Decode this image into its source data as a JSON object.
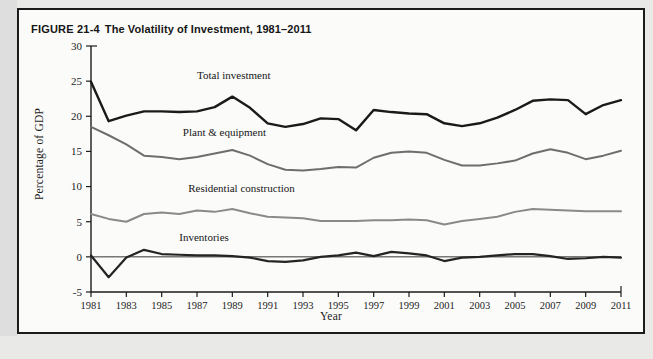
{
  "figure": {
    "number": "FIGURE 21-4",
    "caption": "The Volatility of Investment, 1981–2011"
  },
  "colors": {
    "total_investment": "#1a1a1a",
    "plant_equipment": "#6e6e6e",
    "residential_construction": "#8a8a8a",
    "inventories": "#242424",
    "axis": "#1d1d1d",
    "frame": "#1b1b1b",
    "figure_background": "#fbfbfa",
    "page_background": "#e9e9e7"
  },
  "chart_data": {
    "type": "line",
    "title": "The Volatility of Investment, 1981–2011",
    "xlabel": "Year",
    "ylabel": "Percentage of GDP",
    "xlim": [
      1981,
      2011
    ],
    "ylim": [
      -5,
      30
    ],
    "yticks": [
      -5,
      0,
      5,
      10,
      15,
      20,
      25,
      30
    ],
    "ytick_labels": [
      "-5",
      "0",
      "5",
      "10",
      "15",
      "20",
      "25",
      "30"
    ],
    "xticks": [
      1981,
      1983,
      1985,
      1987,
      1989,
      1991,
      1993,
      1995,
      1997,
      1999,
      2001,
      2003,
      2005,
      2007,
      2009,
      2011
    ],
    "xtick_labels": [
      "1981",
      "1983",
      "1985",
      "1987",
      "1989",
      "1991",
      "1993",
      "1995",
      "1997",
      "1999",
      "2001",
      "2003",
      "2005",
      "2007",
      "2009",
      "2011"
    ],
    "grid": false,
    "legend": "inline-labels",
    "x": [
      1981,
      1982,
      1983,
      1984,
      1985,
      1986,
      1987,
      1988,
      1989,
      1990,
      1991,
      1992,
      1993,
      1994,
      1995,
      1996,
      1997,
      1998,
      1999,
      2000,
      2001,
      2002,
      2003,
      2004,
      2005,
      2006,
      2007,
      2008,
      2009,
      2010,
      2011
    ],
    "series": [
      {
        "name": "Total investment",
        "color": "#1a1a1a",
        "width": 2.4,
        "label_x": 1987,
        "label_y": 25.3,
        "values": [
          24.9,
          19.3,
          20.1,
          20.7,
          20.7,
          20.6,
          20.7,
          21.3,
          22.8,
          21.2,
          19.0,
          18.5,
          18.9,
          19.7,
          19.6,
          18.0,
          20.9,
          20.6,
          20.4,
          20.3,
          19.0,
          18.6,
          19.0,
          19.8,
          20.9,
          22.2,
          22.4,
          22.3,
          20.3,
          21.6,
          22.3
        ]
      },
      {
        "name": "Plant & equipment",
        "color": "#6e6e6e",
        "width": 2.0,
        "label_x": 1986.2,
        "label_y": 17.2,
        "values": [
          18.5,
          17.3,
          16.0,
          14.4,
          14.2,
          13.9,
          14.2,
          14.7,
          15.2,
          14.4,
          13.2,
          12.4,
          12.3,
          12.5,
          12.8,
          12.7,
          14.1,
          14.8,
          15.0,
          14.8,
          13.8,
          13.0,
          13.0,
          13.3,
          13.7,
          14.7,
          15.3,
          14.8,
          13.9,
          14.4,
          15.1
        ]
      },
      {
        "name": "Residential construction",
        "color": "#8a8a8a",
        "width": 2.0,
        "label_x": 1986.5,
        "label_y": 9.2,
        "values": [
          6.1,
          5.4,
          5.0,
          6.1,
          6.3,
          6.1,
          6.6,
          6.4,
          6.8,
          6.2,
          5.7,
          5.6,
          5.5,
          5.1,
          5.1,
          5.1,
          5.2,
          5.2,
          5.3,
          5.2,
          4.6,
          5.1,
          5.4,
          5.7,
          6.4,
          6.8,
          6.7,
          6.6,
          6.5,
          6.5,
          6.5
        ]
      },
      {
        "name": "Inventories",
        "color": "#242424",
        "width": 2.2,
        "label_x": 1986.0,
        "label_y": 2.2,
        "values": [
          0.2,
          -2.9,
          -0.1,
          1.0,
          0.4,
          0.3,
          0.2,
          0.2,
          0.1,
          -0.1,
          -0.6,
          -0.7,
          -0.5,
          0.0,
          0.2,
          0.6,
          0.1,
          0.7,
          0.5,
          0.2,
          -0.6,
          -0.1,
          0.0,
          0.2,
          0.4,
          0.4,
          0.1,
          -0.3,
          -0.2,
          0.0,
          -0.1
        ]
      }
    ]
  }
}
